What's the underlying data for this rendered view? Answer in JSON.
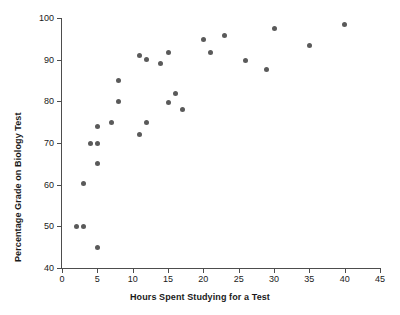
{
  "chart_data": {
    "type": "scatter",
    "title": "",
    "xlabel": "Hours Spent Studying for a Test",
    "ylabel": "Percentage Grade on Biology Test",
    "xlim": [
      0,
      45
    ],
    "ylim": [
      40,
      100
    ],
    "xticks": [
      0,
      5,
      10,
      15,
      20,
      25,
      30,
      35,
      40,
      45
    ],
    "yticks": [
      40,
      50,
      60,
      70,
      80,
      90,
      100
    ],
    "xtick_labels": [
      "0",
      "5",
      "10",
      "15",
      "20",
      "25",
      "30",
      "35",
      "40",
      "45"
    ],
    "ytick_labels": [
      "40",
      "50",
      "60",
      "70",
      "80",
      "90",
      "100"
    ],
    "grid": false,
    "legend": null,
    "marker_color": "#5a5a5a",
    "axis_color": "#4d4d4d",
    "points": [
      {
        "x": 2,
        "y": 50.0
      },
      {
        "x": 3,
        "y": 50.0
      },
      {
        "x": 3,
        "y": 60.2
      },
      {
        "x": 4,
        "y": 70.0
      },
      {
        "x": 5,
        "y": 70.0
      },
      {
        "x": 5,
        "y": 74.0
      },
      {
        "x": 5,
        "y": 65.2
      },
      {
        "x": 5,
        "y": 45.0
      },
      {
        "x": 7,
        "y": 75.0
      },
      {
        "x": 8,
        "y": 85.0
      },
      {
        "x": 8,
        "y": 80.0
      },
      {
        "x": 11,
        "y": 91.0
      },
      {
        "x": 11,
        "y": 72.0
      },
      {
        "x": 12,
        "y": 90.1
      },
      {
        "x": 12,
        "y": 75.0
      },
      {
        "x": 14,
        "y": 89.0
      },
      {
        "x": 15,
        "y": 91.8
      },
      {
        "x": 15,
        "y": 79.8
      },
      {
        "x": 16,
        "y": 82.0
      },
      {
        "x": 17,
        "y": 78.0
      },
      {
        "x": 20,
        "y": 94.9
      },
      {
        "x": 21,
        "y": 91.8
      },
      {
        "x": 23,
        "y": 95.8
      },
      {
        "x": 26,
        "y": 89.7
      },
      {
        "x": 29,
        "y": 87.6
      },
      {
        "x": 30,
        "y": 97.6
      },
      {
        "x": 35,
        "y": 93.5
      },
      {
        "x": 40,
        "y": 98.5
      }
    ]
  }
}
